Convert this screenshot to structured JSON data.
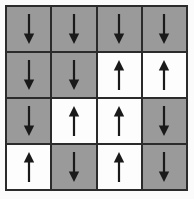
{
  "figure": {
    "name": "spin-lattice-grid",
    "rows": 4,
    "columns": 4,
    "background_color": "#fbfbfb",
    "border_color": "#2b2b2b",
    "gridline_color": "#2b2b2b"
  },
  "legend": {
    "spin_down_label": "down",
    "spin_up_label": "up",
    "spin_down_color": "#9a9a9a",
    "spin_up_color": "#fdfdfd",
    "arrow_color": "#1a1a1a",
    "arrow_down_icon": "arrow-down-icon",
    "arrow_up_icon": "arrow-up-icon"
  },
  "chart_data": {
    "type": "heatmap",
    "title": "",
    "xlabel": "",
    "ylabel": "",
    "categories": [
      "1",
      "2",
      "3",
      "4"
    ],
    "row_labels": [
      "1",
      "2",
      "3",
      "4"
    ],
    "grid": true,
    "legend_position": "none",
    "value_map": {
      "down": -1,
      "up": 1
    },
    "values": [
      [
        -1,
        -1,
        -1,
        -1
      ],
      [
        -1,
        -1,
        1,
        1
      ],
      [
        -1,
        1,
        1,
        -1
      ],
      [
        1,
        -1,
        1,
        -1
      ]
    ],
    "cells": [
      {
        "row": 1,
        "col": 1,
        "spin": "down",
        "value": -1,
        "fill": "#9a9a9a"
      },
      {
        "row": 1,
        "col": 2,
        "spin": "down",
        "value": -1,
        "fill": "#9a9a9a"
      },
      {
        "row": 1,
        "col": 3,
        "spin": "down",
        "value": -1,
        "fill": "#9a9a9a"
      },
      {
        "row": 1,
        "col": 4,
        "spin": "down",
        "value": -1,
        "fill": "#9a9a9a"
      },
      {
        "row": 2,
        "col": 1,
        "spin": "down",
        "value": -1,
        "fill": "#9a9a9a"
      },
      {
        "row": 2,
        "col": 2,
        "spin": "down",
        "value": -1,
        "fill": "#9a9a9a"
      },
      {
        "row": 2,
        "col": 3,
        "spin": "up",
        "value": 1,
        "fill": "#fdfdfd"
      },
      {
        "row": 2,
        "col": 4,
        "spin": "up",
        "value": 1,
        "fill": "#fdfdfd"
      },
      {
        "row": 3,
        "col": 1,
        "spin": "down",
        "value": -1,
        "fill": "#9a9a9a"
      },
      {
        "row": 3,
        "col": 2,
        "spin": "up",
        "value": 1,
        "fill": "#fdfdfd"
      },
      {
        "row": 3,
        "col": 3,
        "spin": "up",
        "value": 1,
        "fill": "#fdfdfd"
      },
      {
        "row": 3,
        "col": 4,
        "spin": "down",
        "value": -1,
        "fill": "#9a9a9a"
      },
      {
        "row": 4,
        "col": 1,
        "spin": "up",
        "value": 1,
        "fill": "#fdfdfd"
      },
      {
        "row": 4,
        "col": 2,
        "spin": "down",
        "value": -1,
        "fill": "#9a9a9a"
      },
      {
        "row": 4,
        "col": 3,
        "spin": "up",
        "value": 1,
        "fill": "#fdfdfd"
      },
      {
        "row": 4,
        "col": 4,
        "spin": "down",
        "value": -1,
        "fill": "#9a9a9a"
      }
    ],
    "counts": {
      "down": 9,
      "up": 7,
      "total": 16
    }
  }
}
